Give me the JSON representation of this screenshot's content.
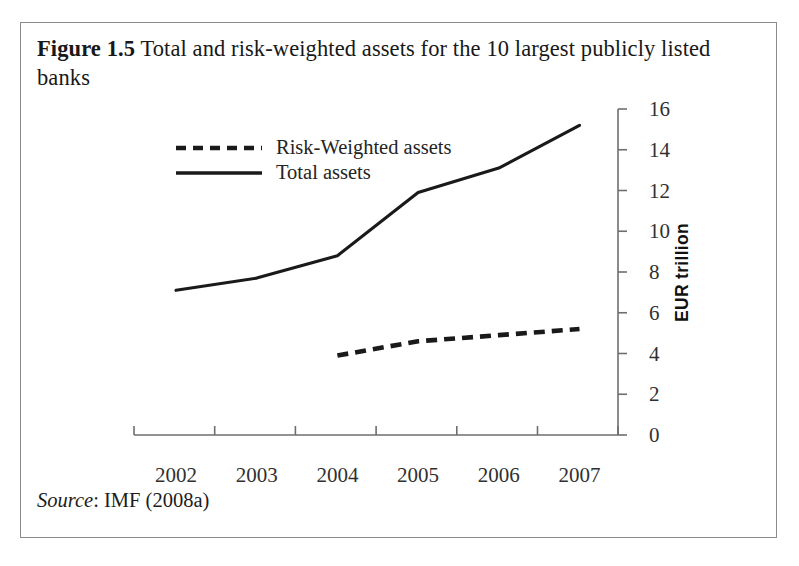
{
  "figure": {
    "label": "Figure 1.5",
    "title": "Total and risk-weighted assets for the 10 largest publicly listed banks",
    "source_label": "Source",
    "source_text": ": IMF (2008a)"
  },
  "legend": {
    "position": "inside-top-left",
    "items": [
      {
        "name": "Risk-Weighted assets",
        "style": "dashed"
      },
      {
        "name": "Total assets",
        "style": "solid"
      }
    ]
  },
  "axes": {
    "y_title": "EUR trillion",
    "y_ticks": [
      16,
      14,
      12,
      10,
      8,
      6,
      4,
      2,
      0
    ],
    "x_ticks": [
      "2002",
      "2003",
      "2004",
      "2005",
      "2006",
      "2007"
    ],
    "y_axis_side": "right",
    "grid": false
  },
  "colors": {
    "line": "#1a1a1a",
    "axis": "#6e6e6e",
    "frame": "#8b8b8b",
    "text": "#1a1a1a",
    "background": "#ffffff"
  },
  "chart_data": {
    "type": "line",
    "title": "Total and risk-weighted assets for the 10 largest publicly listed banks",
    "xlabel": "",
    "ylabel": "EUR trillion",
    "x": [
      "2002",
      "2003",
      "2004",
      "2005",
      "2006",
      "2007"
    ],
    "ylim": [
      0,
      16
    ],
    "ytick_step": 2,
    "grid": false,
    "legend_position": "upper left (inside plot)",
    "y_axis_side": "right",
    "series": [
      {
        "name": "Total assets",
        "style": "solid",
        "x": [
          "2002",
          "2003",
          "2004",
          "2005",
          "2006",
          "2007"
        ],
        "values": [
          7.1,
          7.7,
          8.8,
          11.9,
          13.1,
          15.2
        ]
      },
      {
        "name": "Risk-Weighted assets",
        "style": "dashed",
        "x": [
          "2004",
          "2005",
          "2006",
          "2007"
        ],
        "values": [
          3.9,
          4.6,
          4.9,
          5.2
        ]
      }
    ],
    "source": "IMF (2008a)"
  }
}
